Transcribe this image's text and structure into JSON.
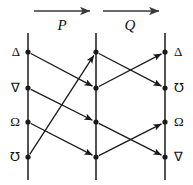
{
  "diagram": {
    "type": "permutation-mapping-diagram",
    "width": 193,
    "height": 185,
    "background_color": "#ffffff",
    "stroke_color": "#1a1a1a",
    "columns": [
      {
        "id": "column-left",
        "x": 28,
        "labels_side": "left",
        "nodes": [
          {
            "row": 1,
            "y": 52,
            "label": "Δ"
          },
          {
            "row": 2,
            "y": 88,
            "label": "∇"
          },
          {
            "row": 3,
            "y": 122,
            "label": "Ω"
          },
          {
            "row": 4,
            "y": 157,
            "label": "℧"
          }
        ]
      },
      {
        "id": "column-middle",
        "x": 96,
        "labels_side": "none",
        "nodes": [
          {
            "row": 1,
            "y": 52,
            "label": ""
          },
          {
            "row": 2,
            "y": 88,
            "label": ""
          },
          {
            "row": 3,
            "y": 122,
            "label": ""
          },
          {
            "row": 4,
            "y": 157,
            "label": ""
          }
        ]
      },
      {
        "id": "column-right",
        "x": 165,
        "labels_side": "right",
        "nodes": [
          {
            "row": 1,
            "y": 52,
            "label": "Δ"
          },
          {
            "row": 2,
            "y": 88,
            "label": "℧"
          },
          {
            "row": 3,
            "y": 122,
            "label": "Ω"
          },
          {
            "row": 4,
            "y": 157,
            "label": "∇"
          }
        ]
      }
    ],
    "operations": [
      {
        "id": "operation-p",
        "label": "P",
        "label_x": 62,
        "label_y": 18,
        "arrow_x1": 34,
        "arrow_x2": 90,
        "arrow_y": 11,
        "mapping": [
          {
            "from_row": 1,
            "to_row": 2
          },
          {
            "from_row": 2,
            "to_row": 3
          },
          {
            "from_row": 3,
            "to_row": 4
          },
          {
            "from_row": 4,
            "to_row": 1
          }
        ]
      },
      {
        "id": "operation-q",
        "label": "Q",
        "label_x": 130,
        "label_y": 18,
        "arrow_x1": 103,
        "arrow_x2": 159,
        "arrow_y": 11,
        "mapping": [
          {
            "from_row": 1,
            "to_row": 2
          },
          {
            "from_row": 2,
            "to_row": 1
          },
          {
            "from_row": 3,
            "to_row": 4
          },
          {
            "from_row": 4,
            "to_row": 3
          }
        ]
      }
    ],
    "axis_top_y": 33,
    "axis_bottom_y": 180,
    "node_radius": 2.6
  }
}
